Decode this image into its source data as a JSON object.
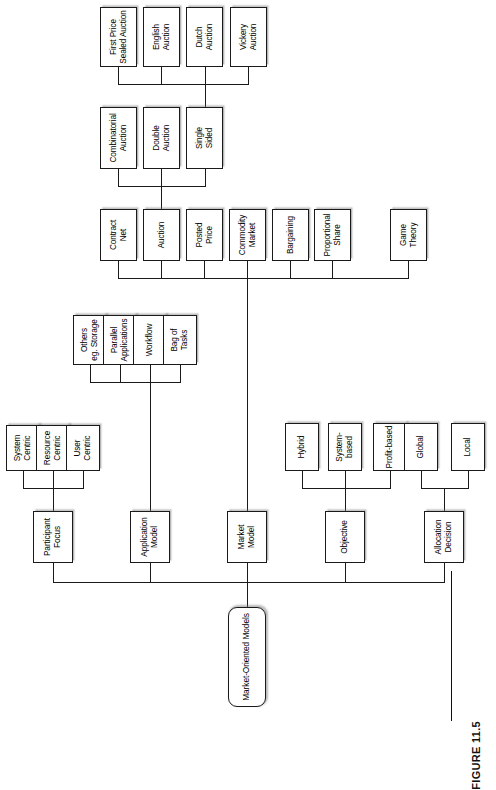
{
  "figure": {
    "caption": "FIGURE 11.5"
  },
  "diagram": {
    "type": "tree",
    "orientation": "rotated-90-ccw",
    "root": "Market-Oriented Models",
    "nodes": {
      "root": "Market-Oriented Models",
      "allocation_decision": "Allocation\nDecision",
      "local": "Local",
      "global": "Global",
      "objective": "Objective",
      "profit_based": "Profit-based",
      "system_based": "System-based",
      "hybrid": "Hybrid",
      "market_model": "Market\nModel",
      "game_theory": "Game\nTheory",
      "proportional_share": "Proportional\nShare",
      "bargaining": "Bargaining",
      "commodity_market": "Commodity\nMarket",
      "posted_price": "Posted\nPrice",
      "auction": "Auction",
      "contract_net": "Contract\nNet",
      "single_sided": "Single\nSided",
      "double_auction": "Double\nAuction",
      "combinatorial_auction": "Combinatorial\nAuction",
      "vickery_auction": "Vickery\nAuction",
      "dutch_auction": "Dutch\nAuction",
      "english_auction": "English\nAuction",
      "first_price_sealed_auction": "First Price\nSealed Auction",
      "application_model": "Application\nModel",
      "bag_of_tasks": "Bag of\nTasks",
      "workflow": "Workflow",
      "parallel_applications": "Parallel\nApplications",
      "others_eg_storage": "Others\neg. Storage",
      "participant_focus": "Participant\nFocus",
      "user_centric": "User\nCentric",
      "resource_centric": "Resource\nCentric",
      "system_centric": "System\nCentric"
    },
    "edges": [
      [
        "root",
        "allocation_decision"
      ],
      [
        "root",
        "objective"
      ],
      [
        "root",
        "market_model"
      ],
      [
        "root",
        "application_model"
      ],
      [
        "root",
        "participant_focus"
      ],
      [
        "allocation_decision",
        "local"
      ],
      [
        "allocation_decision",
        "global"
      ],
      [
        "objective",
        "profit_based"
      ],
      [
        "objective",
        "system_based"
      ],
      [
        "objective",
        "hybrid"
      ],
      [
        "market_model",
        "game_theory"
      ],
      [
        "market_model",
        "proportional_share"
      ],
      [
        "market_model",
        "bargaining"
      ],
      [
        "market_model",
        "commodity_market"
      ],
      [
        "market_model",
        "posted_price"
      ],
      [
        "market_model",
        "auction"
      ],
      [
        "market_model",
        "contract_net"
      ],
      [
        "auction",
        "single_sided"
      ],
      [
        "auction",
        "double_auction"
      ],
      [
        "auction",
        "combinatorial_auction"
      ],
      [
        "single_sided",
        "vickery_auction"
      ],
      [
        "single_sided",
        "dutch_auction"
      ],
      [
        "single_sided",
        "english_auction"
      ],
      [
        "single_sided",
        "first_price_sealed_auction"
      ],
      [
        "application_model",
        "bag_of_tasks"
      ],
      [
        "application_model",
        "workflow"
      ],
      [
        "application_model",
        "parallel_applications"
      ],
      [
        "application_model",
        "others_eg_storage"
      ],
      [
        "participant_focus",
        "user_centric"
      ],
      [
        "participant_focus",
        "resource_centric"
      ],
      [
        "participant_focus",
        "system_centric"
      ]
    ]
  }
}
